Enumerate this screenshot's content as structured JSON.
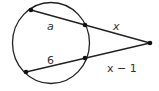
{
  "diagram": {
    "type": "secant-secant",
    "labels": {
      "upper_inner": "a",
      "upper_outer": "x",
      "lower_inner": "6",
      "lower_outer": "x − 1"
    },
    "colors": {
      "stroke": "#222222",
      "text": "#333333"
    }
  }
}
